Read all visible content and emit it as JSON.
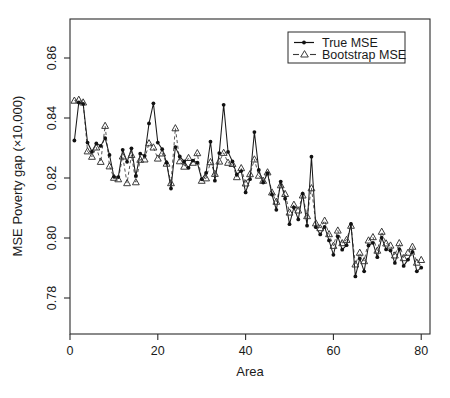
{
  "chart_data": {
    "type": "line",
    "title": "",
    "xlabel": "Area",
    "ylabel": "MSE Poverty gap (×10,000)",
    "xlim": [
      0,
      82
    ],
    "ylim": [
      0.768,
      0.873
    ],
    "grid": false,
    "legend_position": "top-right",
    "xticks": [
      0,
      20,
      40,
      60,
      80
    ],
    "xtick_labels": [
      "0",
      "20",
      "40",
      "60",
      "80"
    ],
    "yticks": [
      0.78,
      0.8,
      0.82,
      0.84,
      0.86
    ],
    "ytick_labels": [
      "0.78",
      "0.80",
      "0.82",
      "0.84",
      "0.86"
    ],
    "x": [
      1,
      2,
      3,
      4,
      5,
      6,
      7,
      8,
      9,
      10,
      11,
      12,
      13,
      14,
      15,
      16,
      17,
      18,
      19,
      20,
      21,
      22,
      23,
      24,
      25,
      26,
      27,
      28,
      29,
      30,
      31,
      32,
      33,
      34,
      35,
      36,
      37,
      38,
      39,
      40,
      41,
      42,
      43,
      44,
      45,
      46,
      47,
      48,
      49,
      50,
      51,
      52,
      53,
      54,
      55,
      56,
      57,
      58,
      59,
      60,
      61,
      62,
      63,
      64,
      65,
      66,
      67,
      68,
      69,
      70,
      71,
      72,
      73,
      74,
      75,
      76,
      77,
      78,
      79,
      80
    ],
    "series": [
      {
        "name": "True MSE",
        "marker": "filled-circle",
        "linestyle": "solid",
        "color": "#111111",
        "values": [
          0.8325,
          0.8452,
          0.8447,
          0.8318,
          0.8288,
          0.8315,
          0.8307,
          0.8333,
          0.8277,
          0.8204,
          0.8203,
          0.8294,
          0.8254,
          0.8299,
          0.8207,
          0.8281,
          0.8274,
          0.8382,
          0.8449,
          0.8318,
          0.8296,
          0.8251,
          0.8165,
          0.8303,
          0.8272,
          0.8255,
          0.8234,
          0.8258,
          0.8251,
          0.8196,
          0.8217,
          0.8321,
          0.8191,
          0.8283,
          0.8444,
          0.8287,
          0.8255,
          0.8212,
          0.8223,
          0.8152,
          0.8196,
          0.8353,
          0.8227,
          0.8185,
          0.8216,
          0.8145,
          0.8094,
          0.8188,
          0.8131,
          0.8046,
          0.8102,
          0.8062,
          0.8148,
          0.8041,
          0.8271,
          0.8036,
          0.8012,
          0.8037,
          0.7992,
          0.7944,
          0.8005,
          0.7961,
          0.7976,
          0.8047,
          0.7872,
          0.7932,
          0.7889,
          0.7975,
          0.7984,
          0.7936,
          0.8001,
          0.7962,
          0.7958,
          0.7917,
          0.7963,
          0.7907,
          0.7928,
          0.7954,
          0.7889,
          0.7901
        ]
      },
      {
        "name": "Bootstrap MSE",
        "marker": "open-triangle",
        "linestyle": "dashed",
        "color": "#3a3a3a",
        "values": [
          0.8458,
          0.8461,
          0.8452,
          0.8289,
          0.8271,
          0.8302,
          0.8254,
          0.8374,
          0.8239,
          0.8201,
          0.8196,
          0.8272,
          0.8183,
          0.8277,
          0.8186,
          0.8261,
          0.8262,
          0.8316,
          0.8302,
          0.8265,
          0.8282,
          0.8248,
          0.8183,
          0.8366,
          0.8256,
          0.8238,
          0.8267,
          0.8251,
          0.8283,
          0.8191,
          0.8199,
          0.8253,
          0.8214,
          0.8255,
          0.8284,
          0.8251,
          0.8247,
          0.8203,
          0.8233,
          0.8182,
          0.8213,
          0.8262,
          0.8208,
          0.8191,
          0.8219,
          0.8152,
          0.8121,
          0.8176,
          0.8147,
          0.8085,
          0.8111,
          0.8092,
          0.8142,
          0.8073,
          0.8166,
          0.8049,
          0.8033,
          0.8058,
          0.8013,
          0.7974,
          0.8025,
          0.7983,
          0.7994,
          0.8041,
          0.7912,
          0.7951,
          0.7923,
          0.7992,
          0.8003,
          0.7958,
          0.8021,
          0.7982,
          0.7975,
          0.7942,
          0.7983,
          0.7933,
          0.7951,
          0.7971,
          0.7918,
          0.7927
        ]
      }
    ]
  },
  "legend": {
    "items": [
      {
        "label": "True MSE",
        "style": "solid-dot"
      },
      {
        "label": "Bootstrap MSE",
        "style": "dashed-triangle"
      }
    ]
  },
  "colors": {
    "axis": "#2b2b2b",
    "true_series": "#111111",
    "bootstrap_series": "#3a3a3a",
    "background": "#ffffff"
  }
}
